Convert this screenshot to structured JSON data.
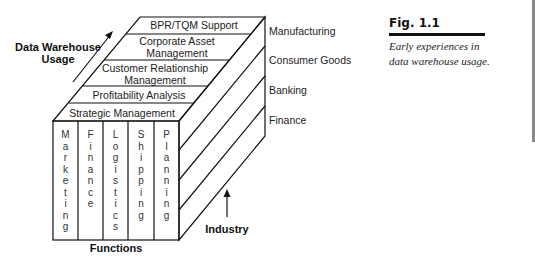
{
  "figure": {
    "number": "Fig. 1.1",
    "caption": "Early experiences in data warehouse usage."
  },
  "axes": {
    "usage_label_line1": "Data Warehouse",
    "usage_label_line2": "Usage",
    "functions_label": "Functions",
    "industry_label": "Industry"
  },
  "usage_layers": [
    {
      "line1": "BPR/TQM Support",
      "line2": ""
    },
    {
      "line1": "Corporate Asset",
      "line2": "Management"
    },
    {
      "line1": "Customer Relationship",
      "line2": "Management"
    },
    {
      "line1": "Profitability Analysis",
      "line2": ""
    },
    {
      "line1": "Strategic Management",
      "line2": ""
    }
  ],
  "functions": [
    "Marketing",
    "Finance",
    "Logistics",
    "Shipping",
    "Planning"
  ],
  "industries": [
    "Manufacturing",
    "Consumer Goods",
    "Banking",
    "Finance"
  ],
  "colors": {
    "line": "#111111",
    "text": "#222222",
    "edge_bar": "#8a8a8a"
  }
}
